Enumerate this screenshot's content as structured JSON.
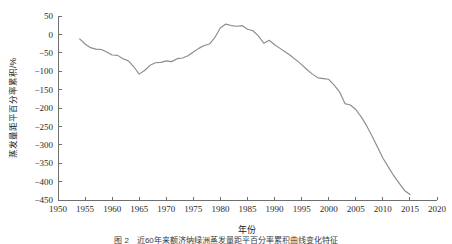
{
  "figure": {
    "caption": "图 2　近60年来额济纳绿洲蒸发量距平百分率累积曲线变化特征",
    "line_color": "#8c8c8c",
    "axis_color": "#6e6e6e",
    "background_color": "#ffffff"
  },
  "chart_data": {
    "type": "line",
    "title": "",
    "xlabel": "年份",
    "ylabel": "蒸发量距平百分率累积/%",
    "xlim": [
      1950,
      2020
    ],
    "ylim": [
      -450,
      50
    ],
    "grid": false,
    "legend": null,
    "xticks": [
      1950,
      1955,
      1960,
      1965,
      1970,
      1975,
      1980,
      1985,
      1990,
      1995,
      2000,
      2005,
      2010,
      2015,
      2020
    ],
    "yticks": [
      50,
      0,
      -50,
      -100,
      -150,
      -200,
      -250,
      -300,
      -350,
      -400,
      -450
    ],
    "xtick_labels": [
      "1950",
      "1955",
      "1960",
      "1965",
      "1970",
      "1975",
      "1980",
      "1985",
      "1990",
      "1995",
      "2000",
      "2005",
      "2010",
      "2015",
      "2020"
    ],
    "ytick_labels": [
      "50",
      "0",
      "−50",
      "−100",
      "−150",
      "−200",
      "−250",
      "−300",
      "−350",
      "−400",
      "−450"
    ],
    "series": [
      {
        "name": "蒸发量距平百分率累积",
        "x": [
          1954,
          1955,
          1956,
          1957,
          1958,
          1959,
          1960,
          1961,
          1962,
          1963,
          1964,
          1965,
          1966,
          1967,
          1968,
          1969,
          1970,
          1971,
          1972,
          1973,
          1974,
          1975,
          1976,
          1977,
          1978,
          1979,
          1980,
          1981,
          1982,
          1983,
          1984,
          1985,
          1986,
          1987,
          1988,
          1989,
          1990,
          1991,
          1992,
          1993,
          1994,
          1995,
          1996,
          1997,
          1998,
          1999,
          2000,
          2001,
          2002,
          2003,
          2004,
          2005,
          2006,
          2007,
          2008,
          2009,
          2010,
          2011,
          2012,
          2013,
          2014,
          2015
        ],
        "values": [
          -12,
          -26,
          -36,
          -40,
          -41,
          -48,
          -56,
          -57,
          -66,
          -72,
          -88,
          -108,
          -98,
          -84,
          -77,
          -76,
          -72,
          -74,
          -66,
          -64,
          -58,
          -48,
          -38,
          -30,
          -26,
          -8,
          18,
          28,
          24,
          22,
          24,
          14,
          10,
          -4,
          -24,
          -16,
          -28,
          -38,
          -48,
          -58,
          -70,
          -82,
          -96,
          -108,
          -118,
          -120,
          -122,
          -138,
          -156,
          -188,
          -192,
          -204,
          -224,
          -248,
          -276,
          -306,
          -336,
          -360,
          -384,
          -404,
          -424,
          -435
        ]
      }
    ]
  },
  "axis_titles": {
    "x": "年份",
    "y": "蒸发量距平百分率累积/%"
  }
}
